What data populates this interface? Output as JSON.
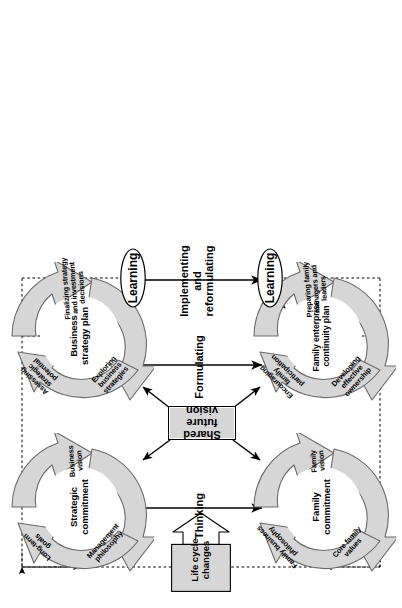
{
  "figure": {
    "orientation": "rotated-90-ccw",
    "colors": {
      "wheel_fill": "#d6d6d6",
      "wheel_stroke": "#555555",
      "box_fill": "#d6d6d6",
      "box_stroke": "#000000",
      "line": "#000000",
      "background": "#ffffff"
    }
  },
  "wheels": {
    "strategic_commitment": {
      "center": "Strategic\ncommitment",
      "segments": [
        {
          "label": "Long-term\ngoals"
        },
        {
          "label": "Business\nvision"
        },
        {
          "label": "Management\nphilosophy"
        }
      ]
    },
    "business_strategy_plan": {
      "center": "Business\nstrategy\nplan",
      "segments": [
        {
          "label": "Assessing\nstrategic\npotential"
        },
        {
          "label": "Finalizing strategy\nand investment\ndecisions"
        },
        {
          "label": "Exploring\nbusiness\nstrategies"
        }
      ]
    },
    "family_commitment": {
      "center": "Family\ncommitment",
      "segments": [
        {
          "label": "Family business\nphilosophy"
        },
        {
          "label": "Family\nvision"
        },
        {
          "label": "Core family\nvalues"
        }
      ]
    },
    "family_enterprise_continuity_plan": {
      "center": "Family\nenterprise\ncontinuity\nplan",
      "segments": [
        {
          "label": "Encouraging\nfamily\nparticipation"
        },
        {
          "label": "Preparing family\nmanagers and\nleaders"
        },
        {
          "label": "Developing\neffective\nownership"
        }
      ]
    }
  },
  "boxes": {
    "life_cycle_changes": "Life cycle\nchanges",
    "shared_future_vision": "Shared future vision"
  },
  "phases": {
    "thinking": "Thinking",
    "formulating": "Formulating",
    "implementing_reformulating": "Implementing\nand\nreformulating"
  },
  "learning": {
    "top": "Learning",
    "bottom": "Learning"
  }
}
